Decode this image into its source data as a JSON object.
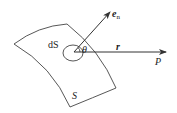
{
  "diagram": {
    "labels": {
      "surface_element": "dS",
      "surface": "S",
      "angle": "θ",
      "normal_vector": "e",
      "normal_subscript": "n",
      "position_vector": "r",
      "point": "P"
    },
    "colors": {
      "line": "#333333",
      "background": "#ffffff"
    }
  }
}
